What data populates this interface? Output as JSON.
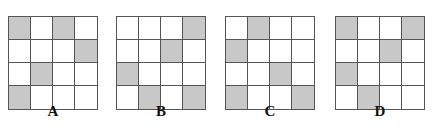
{
  "options": [
    {
      "label": "A",
      "left": 8,
      "cells": [
        [
          1,
          0,
          1,
          0
        ],
        [
          0,
          0,
          0,
          1
        ],
        [
          0,
          1,
          0,
          0
        ],
        [
          1,
          0,
          0,
          0
        ]
      ]
    },
    {
      "label": "B",
      "left": 116,
      "cells": [
        [
          0,
          0,
          0,
          1
        ],
        [
          0,
          0,
          1,
          0
        ],
        [
          1,
          0,
          0,
          0
        ],
        [
          0,
          1,
          0,
          1
        ]
      ]
    },
    {
      "label": "C",
      "left": 225,
      "cells": [
        [
          0,
          1,
          0,
          0
        ],
        [
          1,
          0,
          0,
          0
        ],
        [
          0,
          0,
          1,
          0
        ],
        [
          1,
          0,
          0,
          1
        ]
      ]
    },
    {
      "label": "D",
      "left": 335,
      "cells": [
        [
          1,
          0,
          0,
          1
        ],
        [
          0,
          0,
          1,
          0
        ],
        [
          1,
          0,
          0,
          0
        ],
        [
          0,
          1,
          0,
          0
        ]
      ]
    }
  ],
  "colors": {
    "filled": "#c8c8c8",
    "empty": "#ffffff",
    "border": "#555555"
  }
}
